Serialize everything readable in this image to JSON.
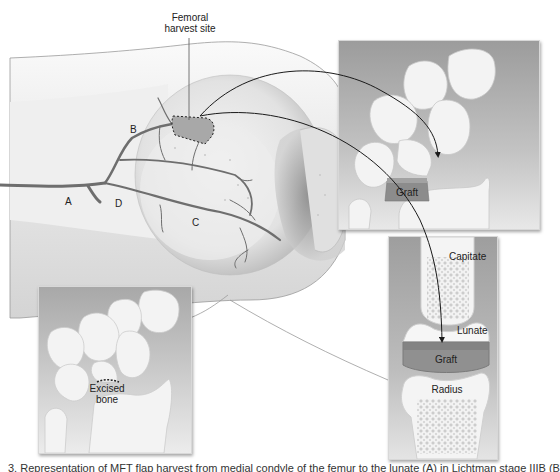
{
  "figure": {
    "title_label": "Femoral\nharvest site",
    "title_line1": "Femoral",
    "title_line2": "harvest site",
    "vessel_labels": {
      "a": "A",
      "b": "B",
      "c": "C",
      "d": "D"
    },
    "panels": {
      "top_right": {
        "graft_label": "Graft"
      },
      "bottom_right": {
        "capitate_label": "Capitate",
        "lunate_label": "Lunate",
        "graft_label": "Graft",
        "radius_label": "Radius"
      },
      "bottom_left": {
        "excised_line1": "Excised",
        "excised_line2": "bone"
      }
    },
    "caption": "3. Representation of MFT flap harvest from medial condyle of the femur to the lunate (A) in Lichtman stage IIIB (B) and SCL 3"
  },
  "colors": {
    "background": "#ffffff",
    "knee_skin": "#ececec",
    "bone_light": "#f4f4f4",
    "vessel": "#6e6e6e",
    "panel_bg": "#a9a9a9",
    "graft": "#8c8c8c",
    "arrow": "#1a1a1a"
  }
}
